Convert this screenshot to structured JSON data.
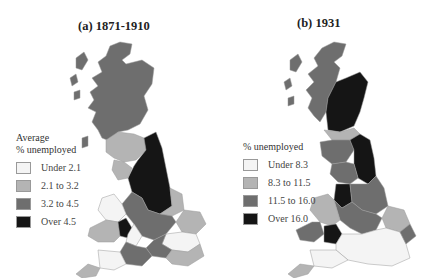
{
  "figure": {
    "panels": [
      {
        "id": "a",
        "title": "(a) 1871-1910",
        "legend": {
          "title_lines": [
            "Average",
            "% unemployed"
          ],
          "items": [
            {
              "label": "Under 2.1",
              "color": "#f4f4f4"
            },
            {
              "label": "2.1 to 3.2",
              "color": "#b4b4b4"
            },
            {
              "label": "3.2 to 4.5",
              "color": "#6e6e6e"
            },
            {
              "label": "Over 4.5",
              "color": "#151515"
            }
          ]
        }
      },
      {
        "id": "b",
        "title": "(b) 1931",
        "legend": {
          "title_lines": [
            "% unemployed"
          ],
          "items": [
            {
              "label": "Under 8.3",
              "color": "#f4f4f4"
            },
            {
              "label": "8.3 to 11.5",
              "color": "#b4b4b4"
            },
            {
              "label": "11.5 to 16.0",
              "color": "#6e6e6e"
            },
            {
              "label": "Over 16.0",
              "color": "#151515"
            }
          ]
        }
      }
    ]
  }
}
